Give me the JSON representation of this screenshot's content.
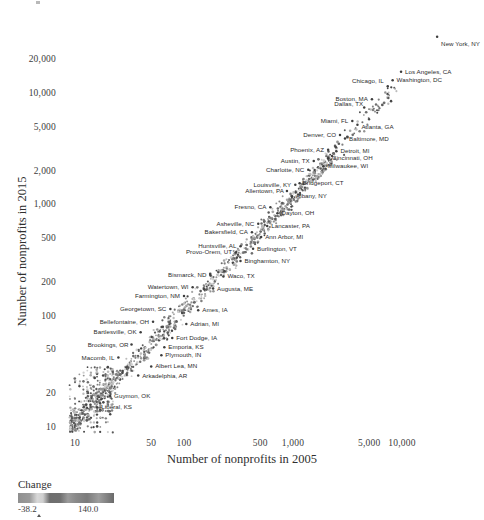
{
  "chart_data": {
    "type": "scatter",
    "title": "",
    "xlabel": "Number of nonprofits in 2005",
    "ylabel": "Number of nonprofits in 2015",
    "xscale": "log",
    "yscale": "log",
    "xlim": [
      8,
      30000
    ],
    "ylim": [
      8,
      30000
    ],
    "grid": false,
    "legend_position": "bottom-left",
    "xticks": [
      "10",
      "50",
      "100",
      "500",
      "1,000",
      "5,000",
      "10,000"
    ],
    "xtick_values": [
      10,
      50,
      100,
      500,
      1000,
      5000,
      10000
    ],
    "yticks": [
      "10",
      "20",
      "50",
      "100",
      "200",
      "500",
      "1,000",
      "2,000",
      "5,000",
      "10,000",
      "20,000"
    ],
    "ytick_values": [
      10,
      20,
      50,
      100,
      200,
      500,
      1000,
      2000,
      5000,
      10000,
      20000
    ],
    "colorbar": {
      "label": "Change",
      "min_label": "-38.2",
      "max_label": "140.0",
      "min": -38.2,
      "max": 140.0,
      "colormap": "grayscale"
    },
    "annotated_points": [
      {
        "label": "New York, NY",
        "x": 21000,
        "y": 32000,
        "side": "right",
        "dx": 4,
        "dy": 7
      },
      {
        "label": "Los Angeles, CA",
        "x": 9800,
        "y": 15500,
        "side": "right",
        "dx": 4,
        "dy": 0
      },
      {
        "label": "Washington, DC",
        "x": 8200,
        "y": 13000,
        "side": "right",
        "dx": 4,
        "dy": 0
      },
      {
        "label": "Chicago, IL",
        "x": 7400,
        "y": 11500,
        "side": "left",
        "dx": -4,
        "dy": -5
      },
      {
        "label": "Boston, MA",
        "x": 5300,
        "y": 8800,
        "side": "left",
        "dx": -4,
        "dy": 0
      },
      {
        "label": "Dallas, TX",
        "x": 4500,
        "y": 7400,
        "side": "left",
        "dx": -1,
        "dy": -4
      },
      {
        "label": "Miami, FL",
        "x": 3500,
        "y": 5600,
        "side": "left",
        "dx": -4,
        "dy": 0
      },
      {
        "label": "Atlanta, GA",
        "x": 3900,
        "y": 5200,
        "side": "right",
        "dx": 4,
        "dy": 2
      },
      {
        "label": "Denver, CO",
        "x": 2700,
        "y": 4200,
        "side": "left",
        "dx": -4,
        "dy": 0
      },
      {
        "label": "Baltimore, MD",
        "x": 3000,
        "y": 3900,
        "side": "right",
        "dx": 4,
        "dy": 0
      },
      {
        "label": "Phoenix, AZ",
        "x": 2100,
        "y": 3100,
        "side": "left",
        "dx": -4,
        "dy": 0
      },
      {
        "label": "Detroit, MI",
        "x": 2500,
        "y": 3000,
        "side": "right",
        "dx": 4,
        "dy": 0
      },
      {
        "label": "Cincinnati, OH",
        "x": 2100,
        "y": 2600,
        "side": "right",
        "dx": 4,
        "dy": 0
      },
      {
        "label": "Austin, TX",
        "x": 1550,
        "y": 2450,
        "side": "left",
        "dx": -4,
        "dy": 0
      },
      {
        "label": "Milwaukee, WI",
        "x": 1900,
        "y": 2200,
        "side": "right",
        "dx": 4,
        "dy": 0
      },
      {
        "label": "Charlotte, NC",
        "x": 1380,
        "y": 2050,
        "side": "left",
        "dx": -4,
        "dy": 0
      },
      {
        "label": "Bridgeport, CT",
        "x": 1150,
        "y": 1550,
        "side": "right",
        "dx": 3,
        "dy": 0
      },
      {
        "label": "Louisville, KY",
        "x": 1050,
        "y": 1500,
        "side": "left",
        "dx": -4,
        "dy": 0
      },
      {
        "label": "Allentown, PA",
        "x": 880,
        "y": 1320,
        "side": "left",
        "dx": -3,
        "dy": 0
      },
      {
        "label": "Albany, NY",
        "x": 980,
        "y": 1180,
        "side": "right",
        "dx": 4,
        "dy": 0
      },
      {
        "label": "Fresno, CA",
        "x": 620,
        "y": 940,
        "side": "left",
        "dx": -4,
        "dy": 0
      },
      {
        "label": "Dayton, OH",
        "x": 720,
        "y": 830,
        "side": "right",
        "dx": 4,
        "dy": 0
      },
      {
        "label": "Asheville, NC",
        "x": 480,
        "y": 670,
        "side": "left",
        "dx": -4,
        "dy": 0
      },
      {
        "label": "Lancaster, PA",
        "x": 580,
        "y": 640,
        "side": "right",
        "dx": 4,
        "dy": 0
      },
      {
        "label": "Bakersfield, CA",
        "x": 420,
        "y": 560,
        "side": "left",
        "dx": -4,
        "dy": 0
      },
      {
        "label": "Ann Arbor, MI",
        "x": 510,
        "y": 510,
        "side": "right",
        "dx": 4,
        "dy": 0
      },
      {
        "label": "Huntsville, AL",
        "x": 330,
        "y": 420,
        "side": "left",
        "dx": -4,
        "dy": 0
      },
      {
        "label": "Burlington, VT",
        "x": 430,
        "y": 400,
        "side": "right",
        "dx": 4,
        "dy": 0
      },
      {
        "label": "Provo-Orem, UT",
        "x": 300,
        "y": 370,
        "side": "left",
        "dx": -4,
        "dy": 0
      },
      {
        "label": "Binghamton, NY",
        "x": 330,
        "y": 310,
        "side": "right",
        "dx": 4,
        "dy": 0
      },
      {
        "label": "Bismarck, ND",
        "x": 175,
        "y": 230,
        "side": "left",
        "dx": -4,
        "dy": 0
      },
      {
        "label": "Waco, TX",
        "x": 230,
        "y": 225,
        "side": "right",
        "dx": 4,
        "dy": 0
      },
      {
        "label": "Watertown, WI",
        "x": 120,
        "y": 180,
        "side": "left",
        "dx": -4,
        "dy": 0
      },
      {
        "label": "Augusta, ME",
        "x": 185,
        "y": 175,
        "side": "right",
        "dx": 4,
        "dy": 0
      },
      {
        "label": "Farmington, NM",
        "x": 100,
        "y": 150,
        "side": "left",
        "dx": -4,
        "dy": 0
      },
      {
        "label": "Georgetown, SC",
        "x": 75,
        "y": 115,
        "side": "left",
        "dx": -4,
        "dy": 0
      },
      {
        "label": "Ames, IA",
        "x": 135,
        "y": 112,
        "side": "right",
        "dx": 4,
        "dy": 0
      },
      {
        "label": "Bellefontaine, OH",
        "x": 52,
        "y": 88,
        "side": "left",
        "dx": -4,
        "dy": 0
      },
      {
        "label": "Adrian, MI",
        "x": 105,
        "y": 84,
        "side": "right",
        "dx": 4,
        "dy": 0
      },
      {
        "label": "Bartlesville, OK",
        "x": 40,
        "y": 71,
        "side": "left",
        "dx": -4,
        "dy": 0
      },
      {
        "label": "Fort Dodge, IA",
        "x": 78,
        "y": 63,
        "side": "right",
        "dx": 4,
        "dy": 0
      },
      {
        "label": "Brookings, OR",
        "x": 33,
        "y": 55,
        "side": "left",
        "dx": -3,
        "dy": 0
      },
      {
        "label": "Emporia, KS",
        "x": 66,
        "y": 52,
        "side": "right",
        "dx": 4,
        "dy": 0
      },
      {
        "label": "Plymouth, IN",
        "x": 62,
        "y": 44,
        "side": "right",
        "dx": 4,
        "dy": 0
      },
      {
        "label": "Macomb, IL",
        "x": 25,
        "y": 42,
        "side": "left",
        "dx": -4,
        "dy": 0
      },
      {
        "label": "Albert Lea, MN",
        "x": 50,
        "y": 35,
        "side": "right",
        "dx": 4,
        "dy": 0
      },
      {
        "label": "Arkadelphia, AR",
        "x": 38,
        "y": 29,
        "side": "right",
        "dx": 4,
        "dy": 0
      },
      {
        "label": "Guymon, OK",
        "x": 21,
        "y": 19,
        "side": "right",
        "dx": 4,
        "dy": 0
      },
      {
        "label": "Liberal, KS",
        "x": 16,
        "y": 15,
        "side": "right",
        "dx": 4,
        "dy": 0
      }
    ]
  }
}
